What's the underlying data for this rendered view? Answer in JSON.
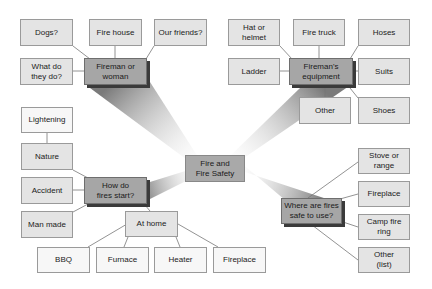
{
  "diagram": {
    "type": "concept-map",
    "center": {
      "id": "center",
      "label": "Fire and\nFire Safety"
    },
    "hubs": [
      {
        "id": "fireman",
        "label": "Fireman or\nwoman",
        "children": [
          "Dogs?",
          "Fire house",
          "Our friends?",
          "What do\nthey do?"
        ]
      },
      {
        "id": "equipment",
        "label": "Fireman's\nequipment",
        "children": [
          "Hat or\nhelmet",
          "Fire truck",
          "Hoses",
          "Ladder",
          "Suits",
          "Other",
          "Shoes"
        ]
      },
      {
        "id": "start",
        "label": "How do\nfires start?",
        "children": [
          "Nature",
          "Accident",
          "Man made",
          "At home"
        ]
      },
      {
        "id": "safe",
        "label": "Where are fires\nsafe to use?",
        "children": [
          "Stove or\nrange",
          "Fireplace",
          "Camp fire\nring",
          "Other\n(list)"
        ]
      }
    ],
    "sub_children": {
      "Nature": [
        "Lightening"
      ],
      "At home": [
        "BBQ",
        "Furnace",
        "Heater",
        "Fireplace"
      ]
    },
    "colors": {
      "leaf_fill": "#e4e4e4",
      "leaf_border": "#9a9a9a",
      "hub_fill": "#a6a6a6",
      "hub_shadow": "#3a3a3a",
      "center_fill": "#a9a9a9",
      "connector": "#777777",
      "beam_dark": "#7a7a7a"
    }
  },
  "nodes": {
    "dogs": "Dogs?",
    "fire_house": "Fire house",
    "our_friends": "Our friends?",
    "what_do": "What do\nthey do?",
    "fireman": "Fireman or\nwoman",
    "hat": "Hat or\nhelmet",
    "fire_truck": "Fire truck",
    "hoses": "Hoses",
    "ladder": "Ladder",
    "equipment": "Fireman's\nequipment",
    "suits": "Suits",
    "other_eq": "Other",
    "shoes": "Shoes",
    "lightening": "Lightening",
    "nature": "Nature",
    "accident": "Accident",
    "man_made": "Man made",
    "how_start": "How do\nfires start?",
    "center": "Fire and\nFire Safety",
    "at_home": "At home",
    "bbq": "BBQ",
    "furnace": "Furnace",
    "heater": "Heater",
    "fireplace_home": "Fireplace",
    "stove": "Stove or\nrange",
    "fireplace_safe": "Fireplace",
    "camp": "Camp fire\nring",
    "other_list": "Other\n(list)",
    "where_safe": "Where are fires\nsafe to use?"
  }
}
